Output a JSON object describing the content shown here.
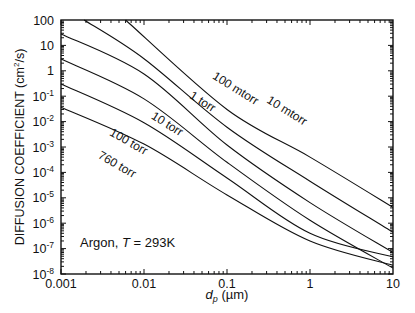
{
  "chart_data": {
    "type": "line",
    "title": "",
    "xlabel": "d_p (µm)",
    "xlabel_main": "d",
    "xlabel_sub": "p",
    "xlabel_unit": " (µm)",
    "ylabel": "DIFFUSION COEFFICIENT (cm²/s)",
    "ylabel_main": "DIFFUSION COEFFICIENT (cm",
    "ylabel_sup": "2",
    "ylabel_end": "/s)",
    "xscale": "log",
    "yscale": "log",
    "xlim": [
      0.001,
      10
    ],
    "ylim": [
      1e-08,
      100
    ],
    "grid": false,
    "xticks": [
      {
        "value": 0.001,
        "label": "0.001"
      },
      {
        "value": 0.01,
        "label": "0.01"
      },
      {
        "value": 0.1,
        "label": "0.1"
      },
      {
        "value": 1,
        "label": "1"
      },
      {
        "value": 10,
        "label": "10"
      }
    ],
    "yticks": [
      {
        "value": 100,
        "base": "100",
        "exp": ""
      },
      {
        "value": 10,
        "base": "10",
        "exp": ""
      },
      {
        "value": 1,
        "base": "1",
        "exp": ""
      },
      {
        "value": 0.1,
        "base": "10",
        "exp": "-1"
      },
      {
        "value": 0.01,
        "base": "10",
        "exp": "-2"
      },
      {
        "value": 0.001,
        "base": "10",
        "exp": "-3"
      },
      {
        "value": 0.0001,
        "base": "10",
        "exp": "-4"
      },
      {
        "value": 1e-05,
        "base": "10",
        "exp": "-5"
      },
      {
        "value": 1e-06,
        "base": "10",
        "exp": "-6"
      },
      {
        "value": 1e-07,
        "base": "10",
        "exp": "-7"
      },
      {
        "value": 1e-08,
        "base": "10",
        "exp": "-8"
      }
    ],
    "annotation": {
      "prefix": "Argon, ",
      "italic": "T",
      "suffix": " = 293K"
    },
    "series": [
      {
        "name": "10 mtorr",
        "points": [
          [
            0.006,
            100
          ],
          [
            0.1,
            0.03
          ],
          [
            1,
            0.0004
          ],
          [
            10,
            4.2e-06
          ]
        ],
        "label_pos": [
          0.5,
          0.02
        ],
        "label_angle": 32
      },
      {
        "name": "100 mtorr",
        "points": [
          [
            0.0019,
            100
          ],
          [
            0.01,
            3
          ],
          [
            0.1,
            0.006
          ],
          [
            1,
            4.5e-05
          ],
          [
            10,
            4.4e-07
          ]
        ],
        "label_pos": [
          0.12,
          0.15
        ],
        "label_angle": 32
      },
      {
        "name": "1 torr",
        "points": [
          [
            0.001,
            28
          ],
          [
            0.01,
            0.75
          ],
          [
            0.1,
            0.0012
          ],
          [
            1,
            6.5e-06
          ],
          [
            10,
            7e-08
          ]
        ],
        "label_pos": [
          0.048,
          0.045
        ],
        "label_angle": 32
      },
      {
        "name": "10 torr",
        "points": [
          [
            0.001,
            2.9
          ],
          [
            0.01,
            0.078
          ],
          [
            0.1,
            0.00025
          ],
          [
            1,
            1.3e-06
          ],
          [
            10,
            1.7e-08
          ]
        ],
        "label_pos": [
          0.018,
          0.006
        ],
        "label_angle": 32
      },
      {
        "name": "100 torr",
        "points": [
          [
            0.001,
            0.3
          ],
          [
            0.01,
            0.009
          ],
          [
            0.1,
            6e-05
          ],
          [
            1,
            4e-07
          ],
          [
            10,
            4.7e-08
          ]
        ],
        "label_pos": [
          0.0062,
          0.0012
        ],
        "label_angle": 30
      },
      {
        "name": "760 torr",
        "points": [
          [
            0.001,
            0.037
          ],
          [
            0.01,
            0.0013
          ],
          [
            0.1,
            1.3e-05
          ],
          [
            1,
            2e-07
          ],
          [
            10,
            2.2e-08
          ]
        ],
        "label_pos": [
          0.0045,
          0.00015
        ],
        "label_angle": 30
      }
    ]
  }
}
